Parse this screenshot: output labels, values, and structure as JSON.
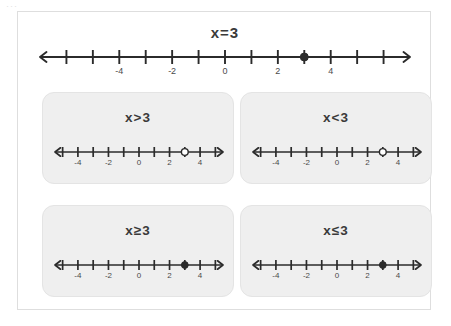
{
  "page": {
    "background_color": "#ffffff",
    "frame_border_color": "#dedede",
    "artifact_text": "···"
  },
  "top": {
    "title": "x 3",
    "relation_label": "x=3",
    "number_line": {
      "min": -7,
      "max": 7,
      "tick_step": 1,
      "labeled_ticks": [
        -4,
        -2,
        0,
        2,
        4
      ],
      "labels": [
        "-4",
        "-2",
        "0",
        "2",
        "4"
      ],
      "point_value": 3,
      "point_style": "closed",
      "left_arrow": true,
      "right_arrow": true,
      "ray": "none"
    }
  },
  "panels": [
    {
      "id": "panel-gt",
      "label": "x>3",
      "number_line": {
        "min": -5.5,
        "max": 5.5,
        "tick_step": 1,
        "labeled_ticks": [
          -4,
          -2,
          0,
          2,
          4
        ],
        "labels": [
          "-4",
          "-2",
          "0",
          "2",
          "4"
        ],
        "point_value": 3,
        "point_style": "open",
        "left_arrow": true,
        "right_arrow": true
      }
    },
    {
      "id": "panel-lt",
      "label": "x<3",
      "number_line": {
        "min": -5.5,
        "max": 5.5,
        "tick_step": 1,
        "labeled_ticks": [
          -4,
          -2,
          0,
          2,
          4
        ],
        "labels": [
          "-4",
          "-2",
          "0",
          "2",
          "4"
        ],
        "point_value": 3,
        "point_style": "open",
        "left_arrow": true,
        "right_arrow": true
      }
    },
    {
      "id": "panel-ge",
      "label": "x≥3",
      "number_line": {
        "min": -5.5,
        "max": 5.5,
        "tick_step": 1,
        "labeled_ticks": [
          -4,
          -2,
          0,
          2,
          4
        ],
        "labels": [
          "-4",
          "-2",
          "0",
          "2",
          "4"
        ],
        "point_value": 3,
        "point_style": "closed",
        "left_arrow": true,
        "right_arrow": true
      }
    },
    {
      "id": "panel-le",
      "label": "x≤3",
      "number_line": {
        "min": -5.5,
        "max": 5.5,
        "tick_step": 1,
        "labeled_ticks": [
          -4,
          -2,
          0,
          2,
          4
        ],
        "labels": [
          "-4",
          "-2",
          "0",
          "2",
          "4"
        ],
        "point_value": 3,
        "point_style": "closed",
        "left_arrow": true,
        "right_arrow": true
      }
    }
  ],
  "colors": {
    "ink": "#2b2b2b",
    "label_text": "#4a4a4a",
    "title_text": "#3a3a3a",
    "panel_fill": "#efefef",
    "panel_border": "#e4e4e4"
  },
  "chart_data": {
    "type": "line",
    "xlabel": "x",
    "ylabel": "",
    "xlim": [
      -7,
      7
    ],
    "grid": false,
    "legend": "none",
    "series": [
      {
        "name": "x=3",
        "relation": "=",
        "boundary": 3,
        "endpoint": "closed",
        "shaded_direction": "none",
        "tick_labels": [
          "-4",
          "-2",
          "0",
          "2",
          "4"
        ],
        "tick_values": [
          -4,
          -2,
          0,
          2,
          4
        ]
      },
      {
        "name": "x>3",
        "relation": ">",
        "boundary": 3,
        "endpoint": "open",
        "shaded_direction": "right",
        "tick_labels": [
          "-4",
          "-2",
          "0",
          "2",
          "4"
        ],
        "tick_values": [
          -4,
          -2,
          0,
          2,
          4
        ]
      },
      {
        "name": "x<3",
        "relation": "<",
        "boundary": 3,
        "endpoint": "open",
        "shaded_direction": "left",
        "tick_labels": [
          "-4",
          "-2",
          "0",
          "2",
          "4"
        ],
        "tick_values": [
          -4,
          -2,
          0,
          2,
          4
        ]
      },
      {
        "name": "x≥3",
        "relation": "≥",
        "boundary": 3,
        "endpoint": "closed",
        "shaded_direction": "right",
        "tick_labels": [
          "-4",
          "-2",
          "0",
          "2",
          "4"
        ],
        "tick_values": [
          -4,
          -2,
          0,
          2,
          4
        ]
      },
      {
        "name": "x≤3",
        "relation": "≤",
        "boundary": 3,
        "endpoint": "closed",
        "shaded_direction": "left",
        "tick_labels": [
          "-4",
          "-2",
          "0",
          "2",
          "4"
        ],
        "tick_values": [
          -4,
          -2,
          0,
          2,
          4
        ]
      }
    ]
  }
}
